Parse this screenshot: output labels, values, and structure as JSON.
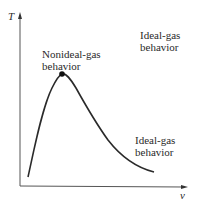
{
  "diagram": {
    "type": "T-v diagram",
    "axes": {
      "y_label": "T",
      "x_label": "v"
    },
    "regions": [
      {
        "id": "nonideal",
        "line1": "Nonideal-gas",
        "line2": "behavior"
      },
      {
        "id": "ideal_top",
        "line1": "Ideal-gas",
        "line2": "behavior"
      },
      {
        "id": "ideal_bottom",
        "line1": "Ideal-gas",
        "line2": "behavior"
      }
    ],
    "critical_point": "dome peak marker",
    "colors": {
      "line": "#2a2a2a",
      "axis": "#555555",
      "background": "#ffffff"
    }
  }
}
